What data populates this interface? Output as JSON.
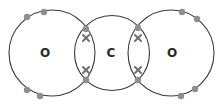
{
  "diagram": {
    "caption_visible_partial": true,
    "colors": {
      "shell_stroke": "#3a3a3a",
      "dot_fill": "#8f8f8f",
      "cross_stroke": "#6f6f6f",
      "label": "#2a2a2a"
    },
    "atoms": [
      {
        "id": "oxygen-left",
        "label": "O",
        "cx": 52,
        "cy": 53,
        "r": 43,
        "label_x": 45
      },
      {
        "id": "carbon",
        "label": "C",
        "cx": 112,
        "cy": 53,
        "r": 37.5,
        "label_x": 111
      },
      {
        "id": "oxygen-right",
        "label": "O",
        "cx": 171,
        "cy": 53,
        "r": 43,
        "label_x": 172
      }
    ],
    "lone_pair_dots": [
      {
        "x": 27,
        "y": 17
      },
      {
        "x": 44,
        "y": 12
      },
      {
        "x": 27,
        "y": 90
      },
      {
        "x": 40,
        "y": 96
      },
      {
        "x": 182,
        "y": 12
      },
      {
        "x": 197,
        "y": 19
      },
      {
        "x": 181,
        "y": 96
      },
      {
        "x": 195,
        "y": 89
      }
    ],
    "bonds": [
      {
        "side": "left",
        "x": 86,
        "dots": [
          29,
          80
        ],
        "crosses": [
          38,
          70
        ]
      },
      {
        "side": "right",
        "x": 138,
        "dots": [
          28,
          80
        ],
        "crosses": [
          38,
          70
        ]
      }
    ]
  }
}
